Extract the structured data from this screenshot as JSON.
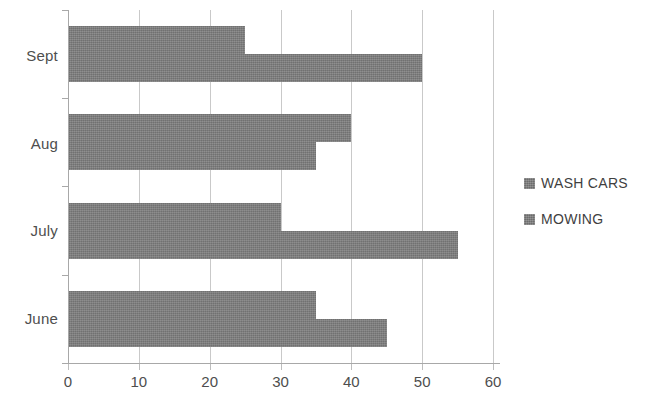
{
  "chart_data": {
    "type": "bar",
    "orientation": "horizontal",
    "title": "",
    "subtitle": "",
    "xlabel": "",
    "ylabel": "",
    "categories": [
      "Sept",
      "Aug",
      "July",
      "June"
    ],
    "series": [
      {
        "name": "WASH CARS",
        "values": [
          25,
          40,
          30,
          35
        ],
        "color": "#7e7e7e"
      },
      {
        "name": "MOWING",
        "values": [
          50,
          35,
          55,
          45
        ],
        "color": "#7e7e7e"
      }
    ],
    "xlim": [
      0,
      60
    ],
    "x_ticks": [
      0,
      10,
      20,
      30,
      40,
      50,
      60
    ],
    "x_tick_labels": [
      "0",
      "10",
      "20",
      "30",
      "40",
      "50",
      "60"
    ],
    "grid": "vertical",
    "legend_position": "right",
    "legend": [
      "WASH CARS",
      "MOWING"
    ],
    "annotations": []
  },
  "axis": {
    "x_tick_labels": [
      "0",
      "10",
      "20",
      "30",
      "40",
      "50",
      "60"
    ],
    "y_category_labels": [
      "Sept",
      "Aug",
      "July",
      "June"
    ]
  },
  "legend": {
    "entries": [
      {
        "label": "WASH CARS"
      },
      {
        "label": "MOWING"
      }
    ]
  }
}
